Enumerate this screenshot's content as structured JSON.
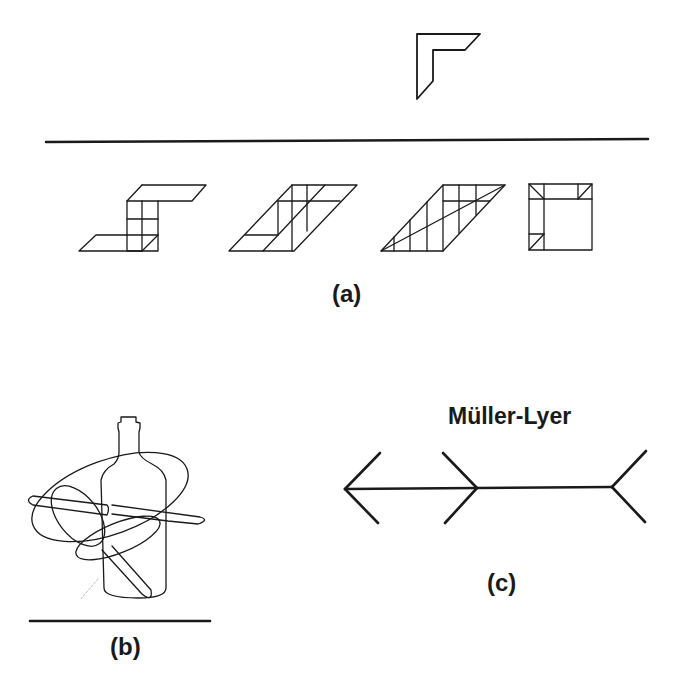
{
  "figure": {
    "panel_a": {
      "label": "(a)",
      "target_shape": "L-shaped parallelogram corner piece",
      "candidate_figures": [
        "S-shaped stepped grid figure",
        "subdivided parallelogram",
        "parallelogram with diagonal subdivisions",
        "square with corner triangles"
      ]
    },
    "panel_b": {
      "label": "(b)",
      "description": "Overlapping outline drawing of a bottle, knife, spoon and ellipse"
    },
    "panel_c": {
      "label": "(c)",
      "title": "Müller-Lyer",
      "description": "Müller-Lyer illusion: two equal line segments with inward and outward fins"
    }
  },
  "colors": {
    "ink": "#1a1a1a",
    "background": "#ffffff"
  }
}
